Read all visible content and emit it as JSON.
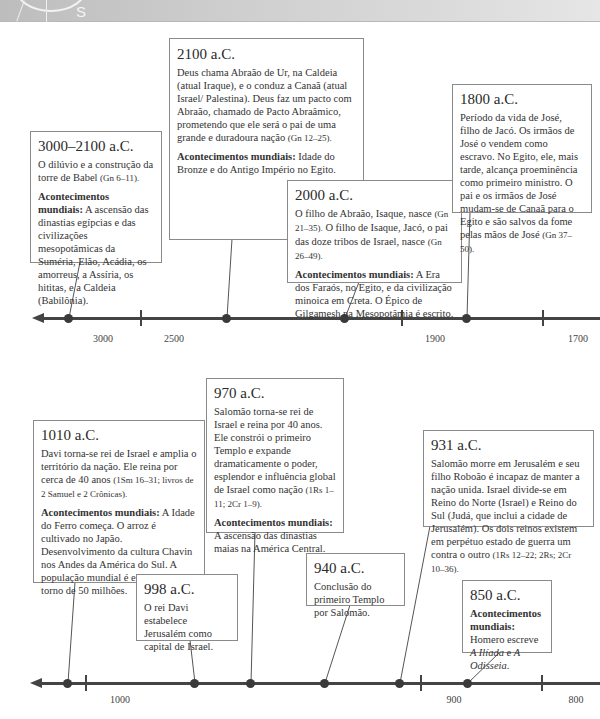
{
  "header": {
    "compass_letter": "S"
  },
  "timeline_top": {
    "axis_labels": [
      "3000",
      "2500",
      "1900",
      "1700"
    ],
    "events": [
      {
        "date": "3000–2100 a.C.",
        "text": "O dilúvio e a construção da torre de Babel ",
        "ref": "(Gn 6–11).",
        "world_label": "Acontecimentos mundiais:",
        "world_text": " A ascensão das dinastias egípcias e das civilizações mesopotâmicas da Suméria, Elão, Acádia, os amorreus, a Assíria, os hititas, e a Caldeia (Babilônia)."
      },
      {
        "date": "2100 a.C.",
        "text": "Deus chama Abraão de Ur, na Caldeia (atual Iraque), e o conduz a Canaã (atual Israel/ Palestina). Deus faz um pacto com Abraão, chamado de Pacto Abraâmico, prometendo que ele será o pai de uma grande e duradoura nação ",
        "ref": "(Gn 12–25).",
        "world_label": "Acontecimentos mundiais:",
        "world_text": " Idade do Bronze e do Antigo Império no Egito."
      },
      {
        "date": "2000 a.C.",
        "text": "O filho de Abraão, Isaque, nasce ",
        "ref": "(Gn 21–35).",
        "text2": " O filho de Isaque, Jacó, o pai das doze tribos de Israel, nasce ",
        "ref2": "(Gn 26–49).",
        "world_label": "Acontecimentos mundiais:",
        "world_text": " A Era dos Faraós, no Egito, e da civilização minoica em Creta. O Épico de Gilgamesh na Mesopotâmia é escrito."
      },
      {
        "date": "1800 a.C.",
        "text": "Período da vida de José, filho de Jacó. Os irmãos de José o vendem como escravo. No Egito, ele, mais tarde, alcança proeminência como primeiro ministro. O pai e os irmãos de José mudam-se de Canaã para o Egito e são salvos da fome pelas mãos de José ",
        "ref": "(Gn 37–50)."
      }
    ]
  },
  "timeline_bottom": {
    "axis_labels": [
      "1000",
      "900",
      "800"
    ],
    "events": [
      {
        "date": "1010 a.C.",
        "text": "Davi torna-se rei de Israel e amplia o território da nação. Ele reina por cerca de 40 anos ",
        "ref": "(1Sm 16–31; livros de 2 Samuel e 2 Crônicas).",
        "world_label": "Acontecimentos mundiais:",
        "world_text": " A Idade do Ferro começa. O arroz é cultivado no Japão. Desenvolvimento da cultura Chavin nos Andes da América do Sul. A população mundial é estimada em torno de 50 milhões."
      },
      {
        "date": "998 a.C.",
        "text": "O rei Davi estabelece Jerusalém como capital de Israel."
      },
      {
        "date": "970 a.C.",
        "text": "Salomão torna-se rei de Israel e reina por 40 anos. Ele constrói o primeiro Templo e expande dramaticamente o poder, esplendor e influência global de Israel como nação ",
        "ref": "(1Rs 1–11; 2Cr 1–9).",
        "world_label": "Acontecimentos mundiais:",
        "world_text": " A ascensão das dinastias maias na América Central."
      },
      {
        "date": "940 a.C.",
        "text": "Conclusão do primeiro Templo por Salomão."
      },
      {
        "date": "931 a.C.",
        "text": "Salomão morre em Jerusalém e seu filho Roboão é incapaz de manter a nação unida. Israel divide-se em Reino do Norte (Israel) e Reino do Sul (Judá, que inclui a cidade de Jerusalém). Os dois reinos existem em perpétuo estado de guerra um contra o outro ",
        "ref": "(1Rs 12–22; 2Rs; 2Cr 10–36)."
      },
      {
        "date": "850 a.C.",
        "world_label": "Acontecimentos mundiais:",
        "world_text_pre": " Homero escreve ",
        "work1": "A Ilíada",
        "world_text_mid": " e ",
        "work2": "A Odisseia",
        "world_text_end": "."
      }
    ]
  },
  "colors": {
    "axis": "#444444",
    "box_border": "#8a8a8a",
    "text": "#333333",
    "header_band": "#cfcfcf"
  }
}
